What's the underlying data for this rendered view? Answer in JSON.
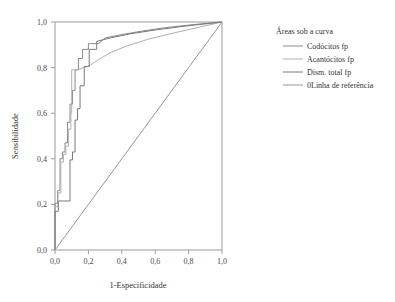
{
  "chart_data": {
    "type": "line",
    "title": "",
    "xlabel": "1-Especificidade",
    "ylabel": "Sensibilidade",
    "xlim": [
      0.0,
      1.0
    ],
    "ylim": [
      0.0,
      1.0
    ],
    "xticks": [
      "0,0",
      "0,2",
      "0,4",
      "0,6",
      "0,8",
      "1,0"
    ],
    "xtick_values": [
      0.0,
      0.2,
      0.4,
      0.6,
      0.8,
      1.0
    ],
    "yticks": [
      "0,0",
      "0,2",
      "0,4",
      "0,6",
      "0,8",
      "1,0"
    ],
    "ytick_values": [
      0.0,
      0.2,
      0.4,
      0.6,
      0.8,
      1.0
    ],
    "grid": false,
    "legend_position": "right",
    "legend_title": "Áreas sob a curva",
    "series": [
      {
        "name": "Codócitos fp",
        "color": "#8a8a8a",
        "points": [
          [
            0.0,
            0.0
          ],
          [
            0.0,
            0.205
          ],
          [
            0.015,
            0.205
          ],
          [
            0.015,
            0.26
          ],
          [
            0.03,
            0.26
          ],
          [
            0.03,
            0.4
          ],
          [
            0.045,
            0.4
          ],
          [
            0.045,
            0.43
          ],
          [
            0.06,
            0.43
          ],
          [
            0.06,
            0.47
          ],
          [
            0.075,
            0.47
          ],
          [
            0.075,
            0.56
          ],
          [
            0.09,
            0.56
          ],
          [
            0.09,
            0.64
          ],
          [
            0.105,
            0.64
          ],
          [
            0.105,
            0.7
          ],
          [
            0.12,
            0.7
          ],
          [
            0.12,
            0.79
          ],
          [
            0.14,
            0.79
          ],
          [
            0.14,
            0.84
          ],
          [
            0.165,
            0.84
          ],
          [
            0.165,
            0.88
          ],
          [
            0.2,
            0.88
          ],
          [
            0.2,
            0.905
          ],
          [
            0.26,
            0.905
          ],
          [
            0.3,
            0.93
          ],
          [
            0.4,
            0.945
          ],
          [
            0.52,
            0.96
          ],
          [
            0.66,
            0.975
          ],
          [
            0.82,
            0.988
          ],
          [
            1.0,
            1.0
          ]
        ]
      },
      {
        "name": "Acantócitos fp",
        "color": "#b0b0b0",
        "points": [
          [
            0.0,
            0.0
          ],
          [
            0.0,
            0.19
          ],
          [
            0.018,
            0.19
          ],
          [
            0.018,
            0.25
          ],
          [
            0.035,
            0.25
          ],
          [
            0.035,
            0.385
          ],
          [
            0.05,
            0.385
          ],
          [
            0.05,
            0.42
          ],
          [
            0.065,
            0.42
          ],
          [
            0.065,
            0.455
          ],
          [
            0.08,
            0.455
          ],
          [
            0.08,
            0.53
          ],
          [
            0.095,
            0.53
          ],
          [
            0.095,
            0.6
          ],
          [
            0.1,
            0.6
          ],
          [
            0.1,
            0.79
          ],
          [
            0.13,
            0.79
          ],
          [
            0.175,
            0.8
          ],
          [
            0.21,
            0.81
          ],
          [
            0.26,
            0.835
          ],
          [
            0.33,
            0.865
          ],
          [
            0.43,
            0.895
          ],
          [
            0.56,
            0.925
          ],
          [
            0.7,
            0.95
          ],
          [
            0.85,
            0.975
          ],
          [
            1.0,
            1.0
          ]
        ]
      },
      {
        "name": "Dism. total fp",
        "color": "#7a7a7a",
        "points": [
          [
            0.0,
            0.0
          ],
          [
            0.0,
            0.17
          ],
          [
            0.02,
            0.17
          ],
          [
            0.02,
            0.215
          ],
          [
            0.09,
            0.215
          ],
          [
            0.09,
            0.395
          ],
          [
            0.105,
            0.395
          ],
          [
            0.105,
            0.43
          ],
          [
            0.12,
            0.43
          ],
          [
            0.12,
            0.57
          ],
          [
            0.135,
            0.57
          ],
          [
            0.135,
            0.62
          ],
          [
            0.15,
            0.62
          ],
          [
            0.15,
            0.72
          ],
          [
            0.175,
            0.72
          ],
          [
            0.175,
            0.805
          ],
          [
            0.205,
            0.805
          ],
          [
            0.205,
            0.88
          ],
          [
            0.25,
            0.88
          ],
          [
            0.25,
            0.915
          ],
          [
            0.33,
            0.93
          ],
          [
            0.45,
            0.948
          ],
          [
            0.6,
            0.965
          ],
          [
            0.78,
            0.982
          ],
          [
            1.0,
            1.0
          ]
        ]
      },
      {
        "name": "0Linha de referência",
        "color": "#989898",
        "points": [
          [
            0.0,
            0.0
          ],
          [
            1.0,
            1.0
          ]
        ]
      }
    ]
  },
  "legend": {
    "title": "Áreas sob a curva",
    "items": [
      {
        "label": "Codócitos fp",
        "color": "#8a8a8a"
      },
      {
        "label": "Acantócitos fp",
        "color": "#b0b0b0"
      },
      {
        "label": "Dism. total fp",
        "color": "#7a7a7a"
      },
      {
        "label": "0Linha de referência",
        "color": "#989898"
      }
    ]
  },
  "axes": {
    "x_title": "1-Especificidade",
    "y_title": "Sensibilidade"
  }
}
